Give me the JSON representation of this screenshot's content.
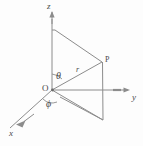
{
  "figure": {
    "kind": "spherical-coordinate-diagram",
    "stroke_color": "#8c8c8c",
    "text_color": "#4a4a4a",
    "background_color": "#fdfdfd"
  },
  "labels": {
    "axis_z": "z",
    "axis_y": "y",
    "axis_x": "x",
    "origin": "O",
    "point": "P",
    "radius": "r",
    "angle_polar": "θ",
    "angle_azimuth": "ϕ"
  },
  "geometry": {
    "origin": {
      "x": 52,
      "y": 90
    },
    "point_p": {
      "x": 102,
      "y": 62
    },
    "z_axis_tip": {
      "x": 52,
      "y": 12
    },
    "y_axis_tip": {
      "x": 130,
      "y": 90
    },
    "x_axis_tip": {
      "x": 10,
      "y": 128
    },
    "z_projection": {
      "x": 52,
      "y": 30
    },
    "xy_projection": {
      "x": 103,
      "y": 120
    },
    "y_foot": {
      "x": 103,
      "y": 90
    }
  }
}
